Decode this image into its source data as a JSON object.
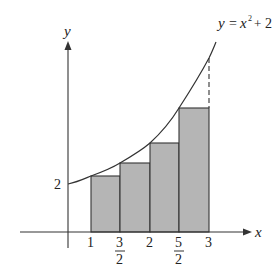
{
  "figure": {
    "type": "riemann-sum-diagram",
    "function_label": {
      "y": "y",
      "eq": "=",
      "x": "x",
      "exp": "2",
      "plus": "+",
      "const": "2"
    },
    "axes": {
      "x_label": "x",
      "y_label": "y"
    },
    "y_tick_label": "2",
    "x_ticks": [
      {
        "num": "1",
        "den": ""
      },
      {
        "num": "3",
        "den": "2"
      },
      {
        "num": "2",
        "den": ""
      },
      {
        "num": "5",
        "den": "2"
      },
      {
        "num": "3",
        "den": ""
      }
    ],
    "rectangles": [
      {
        "x_left": 1,
        "x_right": 1.5,
        "height": 3
      },
      {
        "x_left": 1.5,
        "x_right": 2,
        "height": 4.25
      },
      {
        "x_left": 2,
        "x_right": 2.5,
        "height": 6
      },
      {
        "x_left": 2.5,
        "x_right": 3,
        "height": 8.25
      }
    ],
    "colors": {
      "bar_fill": "#b5b5b5",
      "line": "#333333",
      "background": "#ffffff"
    }
  }
}
